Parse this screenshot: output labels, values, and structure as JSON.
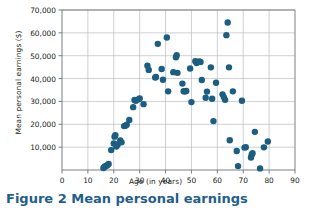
{
  "figure": {
    "caption": "Figure 2 Mean personal earnings"
  },
  "chart_data": {
    "type": "scatter",
    "title": "",
    "xlabel": "Age (in years)",
    "ylabel": "Mean personal earnings ($)",
    "xlim": [
      0,
      90
    ],
    "ylim": [
      0,
      70000
    ],
    "xticks": [
      0,
      10,
      20,
      30,
      40,
      50,
      60,
      70,
      80,
      90
    ],
    "yticks": [
      0,
      10000,
      20000,
      30000,
      40000,
      50000,
      60000,
      70000
    ],
    "ytick_labels": [
      "",
      "10,000",
      "20,000",
      "30,000",
      "40,000",
      "50,000",
      "60,000",
      "70,000"
    ],
    "xtick_labels": [
      "0",
      "10",
      "20",
      "30",
      "40",
      "50",
      "60",
      "70",
      "80",
      "90"
    ],
    "grid": true,
    "legend": "none",
    "marker_color": "#1b5e82",
    "marker_size": 4.6,
    "series": [
      {
        "name": "Mean personal earnings by age",
        "points": [
          [
            16,
            900
          ],
          [
            16.5,
            1500
          ],
          [
            17,
            1700
          ],
          [
            17.5,
            2100
          ],
          [
            18,
            2600
          ],
          [
            19,
            8700
          ],
          [
            20,
            11600
          ],
          [
            20.3,
            14600
          ],
          [
            20.6,
            15200
          ],
          [
            21,
            10300
          ],
          [
            21.5,
            11200
          ],
          [
            22.5,
            12900
          ],
          [
            23,
            12100
          ],
          [
            24,
            19200
          ],
          [
            24.5,
            19400
          ],
          [
            25,
            19800
          ],
          [
            26,
            21900
          ],
          [
            27.5,
            27500
          ],
          [
            28,
            30600
          ],
          [
            28.5,
            30300
          ],
          [
            29.5,
            30900
          ],
          [
            30,
            31300
          ],
          [
            31.5,
            28800
          ],
          [
            33,
            45600
          ],
          [
            33.5,
            43800
          ],
          [
            36,
            40500
          ],
          [
            36.3,
            40700
          ],
          [
            37,
            55200
          ],
          [
            38.5,
            44200
          ],
          [
            39,
            39500
          ],
          [
            40.5,
            58000
          ],
          [
            41,
            34400
          ],
          [
            43,
            42800
          ],
          [
            44,
            49300
          ],
          [
            44.3,
            50200
          ],
          [
            44.6,
            42500
          ],
          [
            46.5,
            37800
          ],
          [
            47,
            34500
          ],
          [
            47.5,
            34300
          ],
          [
            48,
            34600
          ],
          [
            49.5,
            44400
          ],
          [
            50,
            29700
          ],
          [
            51.5,
            47600
          ],
          [
            52,
            46800
          ],
          [
            53,
            47500
          ],
          [
            53.5,
            47300
          ],
          [
            54,
            39400
          ],
          [
            55.5,
            31600
          ],
          [
            56,
            34300
          ],
          [
            57.5,
            44900
          ],
          [
            58,
            31200
          ],
          [
            58.5,
            21400
          ],
          [
            59.5,
            38200
          ],
          [
            62,
            33100
          ],
          [
            62.5,
            31900
          ],
          [
            63,
            30700
          ],
          [
            63.5,
            59000
          ],
          [
            64,
            64500
          ],
          [
            64.5,
            44900
          ],
          [
            64.8,
            13000
          ],
          [
            66,
            34400
          ],
          [
            67.5,
            8300
          ],
          [
            68,
            1700
          ],
          [
            69.5,
            30300
          ],
          [
            70.5,
            9800
          ],
          [
            71,
            10000
          ],
          [
            73,
            5500
          ],
          [
            73.3,
            6800
          ],
          [
            73.6,
            7300
          ],
          [
            74.5,
            16700
          ],
          [
            76.5,
            700
          ],
          [
            78,
            9900
          ],
          [
            79.5,
            12500
          ]
        ]
      }
    ]
  }
}
